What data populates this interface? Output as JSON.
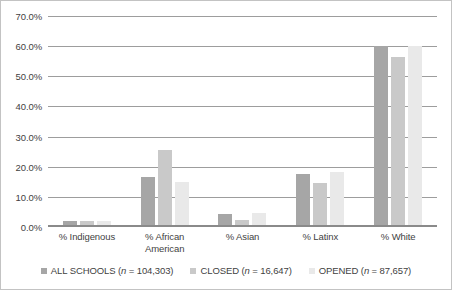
{
  "chart_data": {
    "type": "bar",
    "title": "",
    "xlabel": "",
    "ylabel": "",
    "ylim": [
      0,
      70
    ],
    "ytick_labels": [
      "70.0%",
      "60.0%",
      "50.0%",
      "40.0%",
      "30.0%",
      "20.0%",
      "10.0%",
      "0.0%"
    ],
    "ytick_values": [
      70,
      60,
      50,
      40,
      30,
      20,
      10,
      0
    ],
    "grid": true,
    "legend_position": "bottom",
    "categories": [
      "% Indigenous",
      "% African American",
      "% Asian",
      "% Latinx",
      "% White"
    ],
    "category_lines": [
      [
        "% Indigenous"
      ],
      [
        "% African",
        "American"
      ],
      [
        "% Asian"
      ],
      [
        "% Latinx"
      ],
      [
        "% White"
      ]
    ],
    "series": [
      {
        "name": "ALL SCHOOLS (n = 104,303)",
        "label_prefix": "ALL SCHOOLS (",
        "label_italic": "n",
        "label_suffix": " = 104,303)",
        "color": "#a6a6a6",
        "values": [
          1.8,
          16.2,
          4.1,
          17.5,
          60.0
        ]
      },
      {
        "name": "CLOSED (n = 16,647)",
        "label_prefix": "CLOSED (",
        "label_italic": "n",
        "label_suffix": " = 16,647)",
        "color": "#c9c9c9",
        "values": [
          1.6,
          25.2,
          2.0,
          14.5,
          56.5
        ]
      },
      {
        "name": "OPENED (n = 87,657)",
        "label_prefix": "OPENED (",
        "label_italic": "n",
        "label_suffix": " = 87,657)",
        "color": "#e9e9e9",
        "values": [
          1.7,
          14.8,
          4.2,
          18.1,
          60.0
        ]
      }
    ]
  }
}
